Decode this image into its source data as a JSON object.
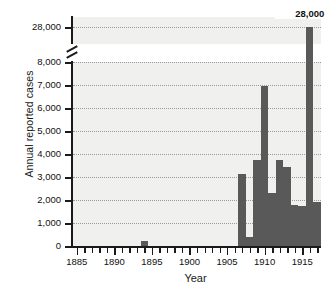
{
  "chart_data": {
    "type": "bar",
    "title": "",
    "xlabel": "Year",
    "ylabel": "Annual reported cases",
    "xlim": [
      1884.5,
      1917.5
    ],
    "ylim": [
      0,
      8000
    ],
    "grid": true,
    "legend": null,
    "axis_break": {
      "present": true,
      "lower_max": 8000,
      "upper_value": 28000,
      "note": "y-axis broken between 8,000 and 28,000"
    },
    "y_ticks": [
      {
        "value": 28000,
        "label": "28,000",
        "segment": "upper"
      },
      {
        "value": 8000,
        "label": "8,000",
        "segment": "lower"
      },
      {
        "value": 7000,
        "label": "7,000",
        "segment": "lower"
      },
      {
        "value": 6000,
        "label": "6,000",
        "segment": "lower"
      },
      {
        "value": 5000,
        "label": "5,000",
        "segment": "lower"
      },
      {
        "value": 4000,
        "label": "4,000",
        "segment": "lower"
      },
      {
        "value": 3000,
        "label": "3,000",
        "segment": "lower"
      },
      {
        "value": 2000,
        "label": "2,000",
        "segment": "lower"
      },
      {
        "value": 1000,
        "label": "1,000",
        "segment": "lower"
      },
      {
        "value": 0,
        "label": "0",
        "segment": "lower"
      }
    ],
    "x_major_ticks": [
      {
        "value": 1885,
        "label": "1885"
      },
      {
        "value": 1890,
        "label": "1890"
      },
      {
        "value": 1895,
        "label": "1895"
      },
      {
        "value": 1900,
        "label": "1900"
      },
      {
        "value": 1905,
        "label": "1905"
      },
      {
        "value": 1910,
        "label": "1910"
      },
      {
        "value": 1915,
        "label": "1915"
      }
    ],
    "x_minor_tick_start": 1885,
    "x_minor_tick_end": 1917,
    "annotations": [
      {
        "text": "28,000",
        "x": 1916,
        "y": 28000
      }
    ],
    "bar_color": "#595959",
    "plot_background": "#f0f0ee",
    "categories": [
      1885,
      1886,
      1887,
      1888,
      1889,
      1890,
      1891,
      1892,
      1893,
      1894,
      1895,
      1896,
      1897,
      1898,
      1899,
      1900,
      1901,
      1902,
      1903,
      1904,
      1905,
      1906,
      1907,
      1908,
      1909,
      1910,
      1911,
      1912,
      1913,
      1914,
      1915,
      1916,
      1917
    ],
    "values": [
      0,
      0,
      0,
      0,
      0,
      0,
      0,
      0,
      0,
      200,
      0,
      0,
      0,
      0,
      0,
      0,
      0,
      0,
      0,
      0,
      0,
      0,
      3150,
      400,
      3750,
      6950,
      2300,
      3750,
      3450,
      1800,
      1750,
      28000,
      1900
    ]
  }
}
